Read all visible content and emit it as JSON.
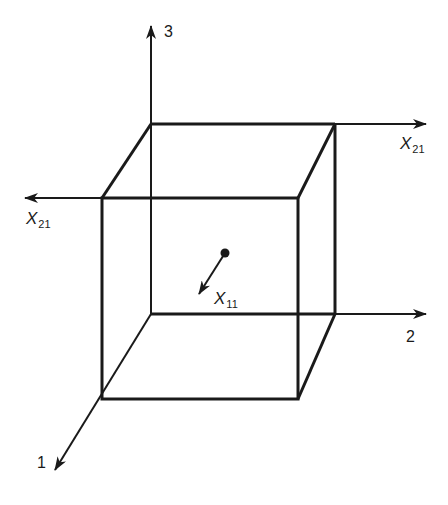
{
  "diagram": {
    "type": "3d-axes-cube",
    "stroke_color": "#1a1a1a",
    "background": "#ffffff",
    "axes": [
      {
        "id": "axis-3",
        "label": "3",
        "direction": "up"
      },
      {
        "id": "axis-2",
        "label": "2",
        "direction": "right"
      },
      {
        "id": "axis-1",
        "label": "1",
        "direction": "down-left"
      }
    ],
    "edge_arrows": [
      {
        "id": "top-right-arrow",
        "label_base": "X",
        "label_sub": "21",
        "direction": "right"
      },
      {
        "id": "left-arrow",
        "label_base": "X",
        "label_sub": "21",
        "direction": "left"
      }
    ],
    "center_vector": {
      "label_base": "X",
      "label_sub": "11",
      "direction": "down-left"
    }
  }
}
